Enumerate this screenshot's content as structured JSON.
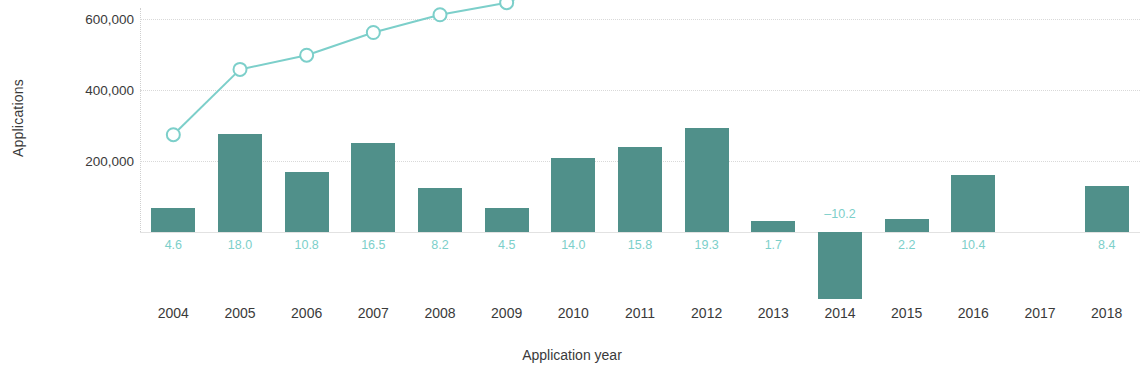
{
  "chart_data": {
    "type": "bar",
    "title": "",
    "xlabel": "Application year",
    "ylabel": "Applications",
    "categories": [
      "2004",
      "2005",
      "2006",
      "2007",
      "2008",
      "2009",
      "2010",
      "2011",
      "2012",
      "2013",
      "2014",
      "2015",
      "2016",
      "2017",
      "2018"
    ],
    "ylim": [
      0,
      1100000
    ],
    "yticks": [
      200000,
      400000,
      600000,
      800000,
      1000000
    ],
    "ytick_labels": [
      "200,000",
      "400,000",
      "600,000",
      "800,000",
      "1,000,000"
    ],
    "grid": true,
    "legend": "none",
    "series": [
      {
        "name": "Applications",
        "type": "bar",
        "values": [
          68000,
          276000,
          168000,
          250000,
          124000,
          68000,
          208000,
          240000,
          294000,
          30000,
          -188000,
          38000,
          160000,
          null,
          130000
        ],
        "data_labels": [
          "4.6",
          "18.0",
          "10.8",
          "16.5",
          "8.2",
          "4.5",
          "14.0",
          "15.8",
          "19.3",
          "1.7",
          "–10.2",
          "2.2",
          "10.4",
          "",
          "8.4"
        ],
        "color": "#50908a",
        "label_color": "#7ccfca"
      },
      {
        "name": "Cumulative applications",
        "type": "line",
        "values": [
          274000,
          458000,
          498000,
          562000,
          612000,
          646000,
          728000,
          836000,
          944000,
          958000,
          910000,
          918000,
          964000,
          950000,
          1020000
        ],
        "color": "#7ccfca",
        "marker": "open-circle",
        "dashed_segments": [
          [
            12,
            13
          ]
        ]
      }
    ]
  },
  "axes": {
    "y_title": "Applications",
    "x_title": "Application year"
  }
}
